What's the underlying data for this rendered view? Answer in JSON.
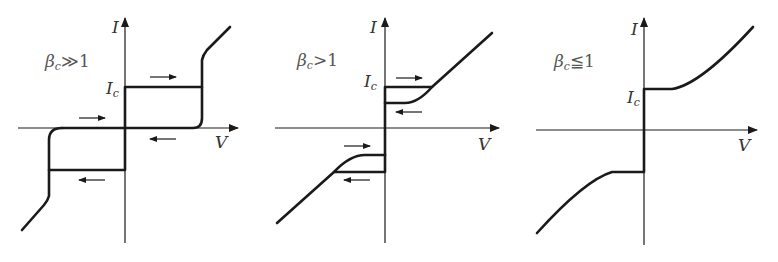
{
  "figure": {
    "axis_labels": {
      "x": "V",
      "y": "I"
    },
    "colors": {
      "line": "#1a1a1a",
      "text": "#333333"
    },
    "panels": [
      {
        "id": "panel-1",
        "condition": {
          "symbol": "β",
          "subscript": "c",
          "relation": "≫1"
        },
        "current_marker": {
          "symbol": "I",
          "subscript": "c"
        },
        "hysteresis": "strong",
        "arrows": [
          "right (upper, above Ic line)",
          "right (above V axis, left side)",
          "left (below V axis, right side)",
          "left (below -Ic line)"
        ]
      },
      {
        "id": "panel-2",
        "condition": {
          "symbol": "β",
          "subscript": "c",
          "relation": ">1"
        },
        "current_marker": {
          "symbol": "I",
          "subscript": "c"
        },
        "hysteresis": "moderate",
        "arrows": [
          "right (above Ic line)",
          "left (below retrapping line)",
          "right (above -Ir line)",
          "left (below -Ic line)"
        ]
      },
      {
        "id": "panel-3",
        "condition": {
          "symbol": "β",
          "subscript": "c",
          "relation": "≦1"
        },
        "current_marker": {
          "symbol": "I",
          "subscript": "c"
        },
        "hysteresis": "none",
        "arrows": []
      }
    ]
  }
}
